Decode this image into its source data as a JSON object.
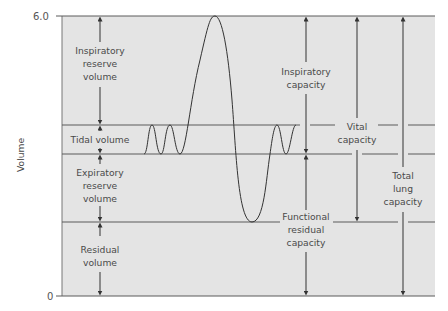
{
  "diagram": {
    "y_axis": {
      "label": "Volume",
      "tick_top": "6.0",
      "tick_bottom": "0"
    },
    "volumes": {
      "irv": [
        "Inspiratory",
        "reserve",
        "volume"
      ],
      "tv": [
        "Tidal volume"
      ],
      "erv": [
        "Expiratory",
        "reserve",
        "volume"
      ],
      "rv": [
        "Residual",
        "volume"
      ]
    },
    "capacities": {
      "ic": [
        "Inspiratory",
        "capacity"
      ],
      "frc": [
        "Functional",
        "residual",
        "capacity"
      ],
      "vc": [
        "Vital",
        "capacity"
      ],
      "tlc": [
        "Total",
        "lung",
        "capacity"
      ]
    },
    "colors": {
      "panel": "#e4e4e4",
      "line": "#5a5a5a",
      "text": "#4a4a4a"
    }
  }
}
